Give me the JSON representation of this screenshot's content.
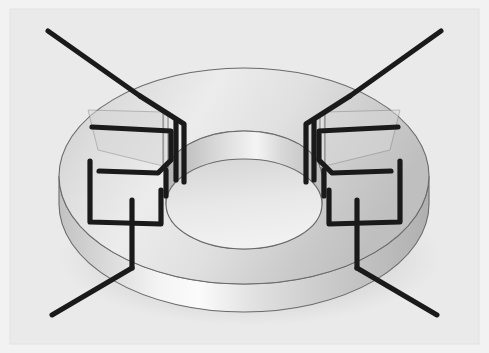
{
  "figure": {
    "title": "Toroidal core with wire winding",
    "object_name": "toroid",
    "view": "perspective",
    "canvas": {
      "width": 489,
      "height": 353
    }
  },
  "colors": {
    "page_background": "#f2f2f2",
    "panel_background": "#eaeaea",
    "panel_border": "#e2e2e2",
    "wire": "#1a1a1a",
    "outline": "#4a4a4a",
    "top_face_light": "#efefef",
    "top_face_mid": "#d6d6d6",
    "top_face_dark": "#bdbdbd",
    "outer_wall_light": "#fbfbfb",
    "outer_wall_mid": "#d2d2d2",
    "outer_wall_dark": "#b2b2b2",
    "inner_wall_light": "#f6f6f6",
    "inner_wall_mid": "#c9c9c9",
    "inner_wall_dark": "#a9a9a9",
    "hole_floor": "#e4e4e4",
    "shadow": "#c6c6c6"
  },
  "geometry": {
    "torus_center_x": 244,
    "torus_center_y": 176,
    "outer_radius_x": 185,
    "outer_radius_y": 108,
    "inner_radius_x": 78,
    "inner_radius_y": 45,
    "body_height": 72,
    "notch_count": 2,
    "winding_turns_per_side": 3
  },
  "elements": {
    "panel_label": "figure-panel",
    "torus_top_label": "torus-top-face",
    "torus_outer_label": "torus-outer-wall",
    "torus_inner_label": "torus-inner-wall",
    "hole_label": "torus-center-hole",
    "shadow_label": "torus-ground-shadow",
    "winding_left_label": "winding-coil-left",
    "winding_right_label": "winding-coil-right",
    "lead_top_left_label": "lead-wire-top-left",
    "lead_top_right_label": "lead-wire-top-right",
    "lead_bottom_left_label": "lead-wire-bottom-left",
    "lead_bottom_right_label": "lead-wire-bottom-right"
  },
  "leads": [
    {
      "name": "top-left",
      "x1": 48,
      "y1": 31,
      "x2": 140,
      "y2": 96
    },
    {
      "name": "top-right",
      "x1": 441,
      "y1": 31,
      "x2": 350,
      "y2": 96
    },
    {
      "name": "bottom-left",
      "x1": 52,
      "y1": 315,
      "x2": 132,
      "y2": 268
    },
    {
      "name": "bottom-right",
      "x1": 437,
      "y1": 315,
      "x2": 357,
      "y2": 268
    }
  ]
}
